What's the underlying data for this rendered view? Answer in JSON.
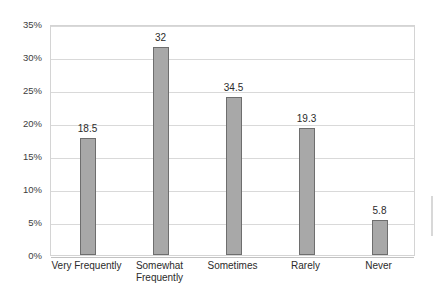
{
  "chart_data": {
    "type": "bar",
    "title": "",
    "xlabel": "",
    "ylabel": "",
    "categories": [
      "Very Frequently",
      "Somewhat Frequently",
      "Sometimes",
      "Rarely",
      "Never"
    ],
    "category_lines": [
      [
        "Very Frequently"
      ],
      [
        "Somewhat",
        "Frequently"
      ],
      [
        "Sometimes"
      ],
      [
        "Rarely"
      ],
      [
        "Never"
      ]
    ],
    "data_labels": [
      "18.5",
      "32",
      "34.5",
      "19.3",
      "5.8"
    ],
    "values": [
      17.8,
      31.5,
      23.9,
      19.2,
      5.3
    ],
    "ylim": [
      0,
      35
    ],
    "ytick_values": [
      0,
      5,
      10,
      15,
      20,
      25,
      30,
      35
    ],
    "ytick_labels": [
      "0%",
      "5%",
      "10%",
      "15%",
      "20%",
      "25%",
      "30%",
      "35%"
    ],
    "grid": true,
    "legend": false,
    "legend_position": "none",
    "colors": {
      "bar_fill": "#a8a8a8",
      "bar_border": "#6e6e6e",
      "gridline": "#d9d9d9",
      "plot_border": "#d4d4d4",
      "axis_text": "#3d3d3d",
      "label_text": "#2b2b2b",
      "background": "#ffffff"
    }
  }
}
